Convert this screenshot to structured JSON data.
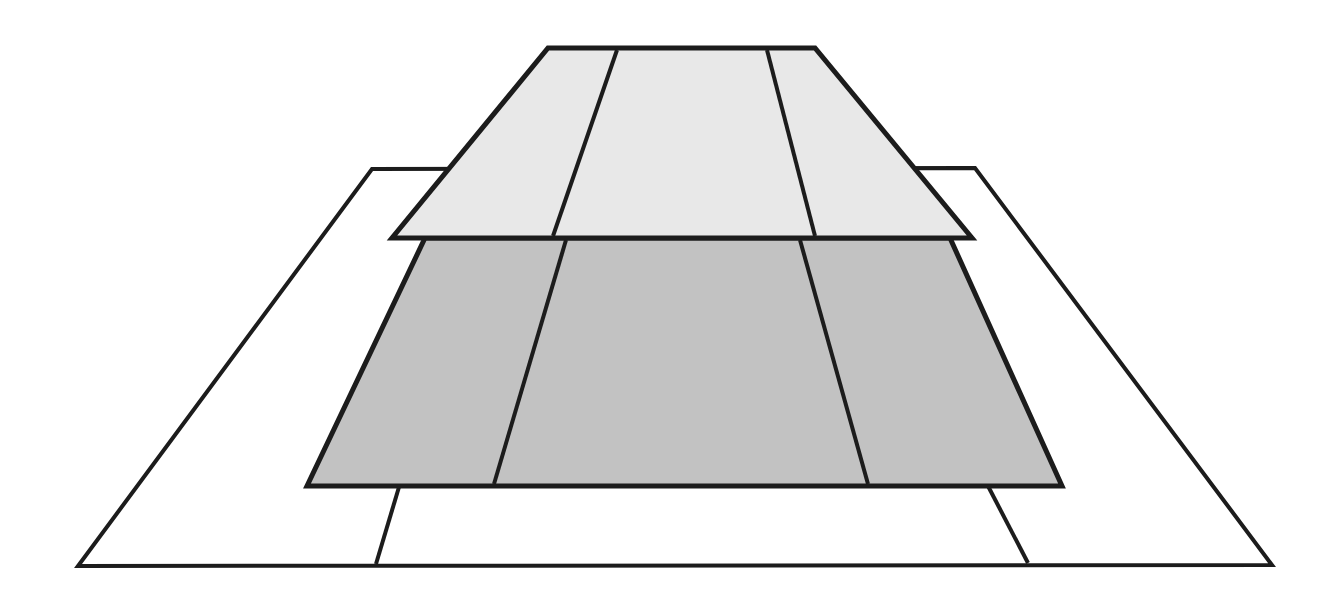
{
  "canvas": {
    "width": 1338,
    "height": 593,
    "background_color": "#ffffff",
    "title": "Layered Trapezoid Diagram"
  },
  "style": {
    "stroke_color": "#1c1c1c",
    "outer_fill": "#ffffff",
    "middle_fill": "#c2c2c2",
    "upper_fill": "#e8e8e8",
    "outer_stroke_width": 4,
    "middle_stroke_width": 5,
    "upper_stroke_width": 5,
    "divider_stroke_width": 4
  },
  "layers": [
    {
      "id": "outer-layer",
      "name": "outer-trapezoid",
      "fill": "#ffffff",
      "stroke_width": 4,
      "points": "372,169 975,168 1272,565 78,566",
      "corners": {
        "top_left": [
          372,
          169
        ],
        "top_right": [
          975,
          168
        ],
        "bottom_right": [
          1272,
          565
        ],
        "bottom_left": [
          78,
          566
        ]
      },
      "dividers": [
        {
          "id": "outer-divider-left",
          "x1": 399,
          "y1": 487,
          "x2": 376,
          "y2": 564
        },
        {
          "id": "outer-divider-right",
          "x1": 988,
          "y1": 486,
          "x2": 1028,
          "y2": 563
        }
      ]
    },
    {
      "id": "middle-layer",
      "name": "middle-trapezoid",
      "fill": "#c2c2c2",
      "stroke_width": 5,
      "points": "425,238 950,238 1062,486 307,486",
      "corners": {
        "top_left": [
          425,
          238
        ],
        "top_right": [
          950,
          238
        ],
        "bottom_right": [
          1062,
          486
        ],
        "bottom_left": [
          307,
          486
        ]
      },
      "dividers": [
        {
          "id": "middle-divider-left",
          "x1": 566,
          "y1": 240,
          "x2": 494,
          "y2": 484
        },
        {
          "id": "middle-divider-right",
          "x1": 800,
          "y1": 240,
          "x2": 868,
          "y2": 484
        }
      ]
    },
    {
      "id": "upper-layer",
      "name": "upper-trapezoid",
      "fill": "#e8e8e8",
      "stroke_width": 5,
      "points": "548,48 815,48 972,238 392,238",
      "corners": {
        "top_left": [
          548,
          48
        ],
        "top_right": [
          815,
          48
        ],
        "bottom_right": [
          972,
          238
        ],
        "bottom_left": [
          392,
          238
        ]
      },
      "dividers": [
        {
          "id": "upper-divider-left",
          "x1": 617,
          "y1": 50,
          "x2": 553,
          "y2": 236
        },
        {
          "id": "upper-divider-right",
          "x1": 767,
          "y1": 50,
          "x2": 815,
          "y2": 236
        }
      ]
    }
  ]
}
